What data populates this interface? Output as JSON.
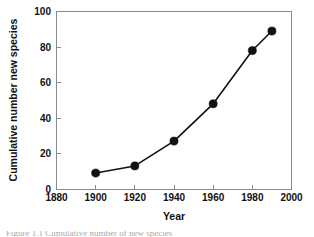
{
  "figure": {
    "caption_partial": "Figure 1.1  Cumulative number of new species"
  },
  "chart_data": {
    "type": "line",
    "title": "",
    "xlabel": "Year",
    "ylabel": "Cumulative number new species",
    "xlim": [
      1880,
      2000
    ],
    "ylim": [
      0,
      100
    ],
    "xticks": [
      1880,
      1900,
      1920,
      1940,
      1960,
      1980,
      2000
    ],
    "xtick_labels": [
      "1880",
      "1900",
      "1920",
      "1940",
      "1960",
      "1980",
      "2000"
    ],
    "yticks": [
      0,
      20,
      40,
      60,
      80,
      100
    ],
    "ytick_labels": [
      "0",
      "20",
      "40",
      "60",
      "80",
      "100"
    ],
    "grid": false,
    "legend": "none",
    "marker": "filled-circle",
    "marker_color": "#111111",
    "line_color": "#111111",
    "x": [
      1900,
      1920,
      1940,
      1960,
      1980,
      1990
    ],
    "values": [
      9,
      13,
      27,
      48,
      78,
      89
    ],
    "points": [
      {
        "x": 1900,
        "y": 9
      },
      {
        "x": 1920,
        "y": 13
      },
      {
        "x": 1940,
        "y": 27
      },
      {
        "x": 1960,
        "y": 48
      },
      {
        "x": 1980,
        "y": 78
      },
      {
        "x": 1990,
        "y": 89
      }
    ]
  }
}
